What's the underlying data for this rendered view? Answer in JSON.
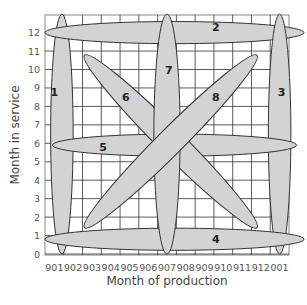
{
  "chart_data": {
    "type": "diagram",
    "title": "",
    "xlabel": "Month of production",
    "ylabel": "Month in service",
    "x_ticks": [
      "901",
      "902",
      "903",
      "904",
      "905",
      "906",
      "907",
      "908",
      "909",
      "910",
      "911",
      "912",
      "001"
    ],
    "y_ticks": [
      "0",
      "1",
      "2",
      "3",
      "4",
      "5",
      "6",
      "7",
      "8",
      "9",
      "10",
      "11",
      "12"
    ],
    "grid": true,
    "colors": {
      "ellipse_fill": "#d3d3d3",
      "ellipse_stroke": "#333333",
      "grid": "#333333",
      "frame": "#888888"
    },
    "ellipses": [
      {
        "label": "1",
        "desc": "vertical at production 901",
        "cx": 0.4,
        "cy": 6.5,
        "rx": 0.6,
        "ry": 6.5,
        "angle": 0,
        "label_pos": [
          0.0,
          8.8
        ]
      },
      {
        "label": "2",
        "desc": "horizontal at service 12",
        "cx": 6.4,
        "cy": 12.0,
        "rx": 6.9,
        "ry": 0.6,
        "angle": 0,
        "label_pos": [
          8.6,
          12.3
        ]
      },
      {
        "label": "3",
        "desc": "vertical at production 001",
        "cx": 12.0,
        "cy": 6.5,
        "rx": 0.6,
        "ry": 6.5,
        "angle": 0,
        "label_pos": [
          12.1,
          8.8
        ]
      },
      {
        "label": "4",
        "desc": "horizontal at service 1",
        "cx": 6.4,
        "cy": 0.8,
        "rx": 6.9,
        "ry": 0.6,
        "angle": 0,
        "label_pos": [
          8.6,
          0.8
        ]
      },
      {
        "label": "5",
        "desc": "horizontal at service 6",
        "cx": 6.4,
        "cy": 5.9,
        "rx": 6.5,
        "ry": 0.6,
        "angle": 0,
        "label_pos": [
          2.6,
          5.8
        ]
      },
      {
        "label": "6",
        "desc": "diagonal descending",
        "cx": 6.2,
        "cy": 6.1,
        "rx": 6.5,
        "ry": 0.7,
        "angle": 45,
        "label_pos": [
          3.8,
          8.5
        ]
      },
      {
        "label": "7",
        "desc": "vertical at production 907",
        "cx": 6.0,
        "cy": 6.5,
        "rx": 0.7,
        "ry": 6.5,
        "angle": 0,
        "label_pos": [
          6.1,
          10.0
        ]
      },
      {
        "label": "8",
        "desc": "diagonal ascending",
        "cx": 6.2,
        "cy": 6.1,
        "rx": 6.5,
        "ry": 0.7,
        "angle": -45,
        "label_pos": [
          8.6,
          8.5
        ]
      }
    ]
  }
}
